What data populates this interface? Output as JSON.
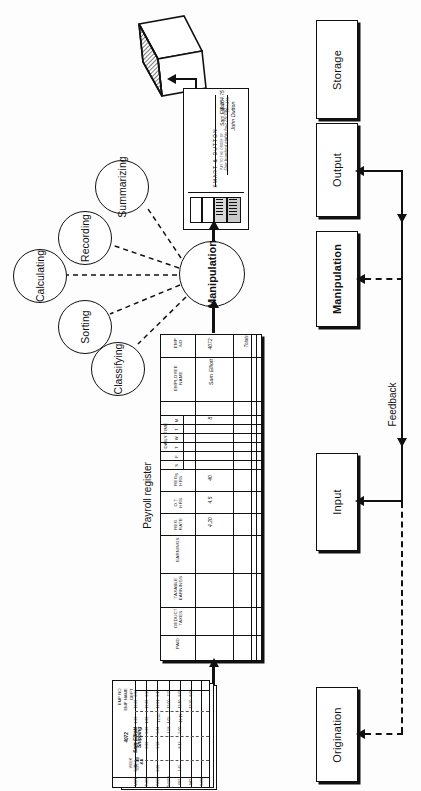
{
  "diagram": {
    "flow_boxes": [
      {
        "id": "storage",
        "label": "Storage"
      },
      {
        "id": "output",
        "label": "Output"
      },
      {
        "id": "manipulation",
        "label": "Manipulation"
      },
      {
        "id": "input",
        "label": "Input"
      },
      {
        "id": "origination",
        "label": "Origination"
      }
    ],
    "feedback_label": "Feedback",
    "manipulation_hub": {
      "label": "Manipulation"
    },
    "satellites": [
      {
        "id": "summarizing",
        "label": "Summarizing"
      },
      {
        "id": "recording",
        "label": "Recording"
      },
      {
        "id": "calculating",
        "label": "Calculating"
      },
      {
        "id": "sorting",
        "label": "Sorting"
      },
      {
        "id": "classifying",
        "label": "Classifying"
      }
    ]
  },
  "register": {
    "caption": "Payroll register",
    "group_header": "DAILY TIME",
    "day_columns": [
      "M",
      "T",
      "W",
      "T",
      "F",
      "S",
      "S"
    ],
    "columns": [
      {
        "id": "emp-no",
        "label": "EMP\nNO"
      },
      {
        "id": "employee-name",
        "label": "EMPLOYEE\nNAME"
      },
      {
        "id": "daily-time",
        "label": "DAILY TIME"
      },
      {
        "id": "reg-hrs",
        "label": "REG.\nHRS."
      },
      {
        "id": "ot-hrs",
        "label": "O.T.\nHRS."
      },
      {
        "id": "reg-rate",
        "label": "REG.\nRATE"
      },
      {
        "id": "earnings",
        "label": "EARNINGS"
      },
      {
        "id": "taxable-earnings",
        "label": "TAXABLE\nEARNINGS"
      },
      {
        "id": "deduct-taxes",
        "label": "DEDUCT\nTAXES"
      },
      {
        "id": "paid",
        "label": "PAID"
      }
    ],
    "first_row": {
      "emp_no": "4072",
      "employee_name": "Sam Elliott",
      "monday": "8",
      "reg_hrs": "40",
      "ot_hrs": "4.5",
      "reg_rate": "4.20"
    },
    "total_label": "Totals"
  },
  "timecard": {
    "labels": [
      "EMP NO",
      "EMP NAME",
      "DEPT"
    ],
    "column_headers": [
      "IN",
      "OUT",
      "IN",
      "OUT",
      "WEEK\nREG.",
      "O.T.",
      "TOTAL"
    ],
    "emp_no": "4072",
    "emp_name": "Sam Elliott",
    "dept": "Shipping",
    "week_reg": "40",
    "week_ot": "4.5",
    "rows": [
      {
        "day": "MON",
        "cells": [
          "8:00",
          "12:00",
          "1:00",
          "5:00",
          "8:00",
          "",
          "8:00"
        ]
      },
      {
        "day": "TUES",
        "cells": [
          "8:59",
          "12:00",
          "1:00",
          "5:00",
          "8:00",
          "",
          ""
        ]
      },
      {
        "day": "WED",
        "cells": [
          "8:15",
          "12:01",
          "12:50",
          "5:04",
          "5:58",
          "",
          "8:00"
        ]
      },
      {
        "day": "THURS",
        "cells": [
          "7:55",
          "12:00",
          "1:05",
          "4:58",
          "",
          "",
          ""
        ]
      },
      {
        "day": "FRI",
        "cells": [
          "8:00",
          "12:10",
          "12:15",
          "5:00",
          "8:13",
          "",
          "7:45"
        ]
      },
      {
        "day": "SAT",
        "cells": [
          "8:00",
          "12:30",
          "",
          "",
          "",
          "",
          ""
        ]
      },
      {
        "day": "SUN",
        "cells": [
          "",
          "",
          "",
          "",
          "",
          "",
          ""
        ]
      }
    ]
  },
  "check": {
    "company": "SMART & DUTTON",
    "pay_to_label": "PAY TO THE\nORDER OF",
    "payee": "Sam Elliott",
    "amount": "$ 184.75",
    "amount_words": "One hundred eighty four 75/100",
    "dollars_label": "DOLLARS",
    "signature": "John Dutton"
  },
  "ledger": {
    "name": "ledger-stack"
  },
  "colors": {
    "ink": "#111111",
    "paper": "#ffffff",
    "background": "#fdfdfd"
  }
}
